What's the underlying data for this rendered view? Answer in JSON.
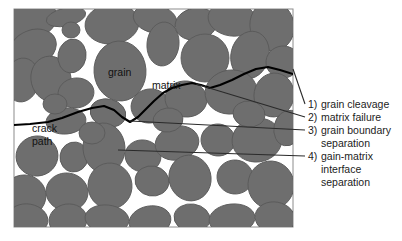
{
  "figure": {
    "colors": {
      "grain_fill": "#6e6e6e",
      "grain_stroke": "#5a5a5a",
      "matrix_fill": "#ffffff",
      "crack_line": "#000000",
      "leader_line": "#2a2a2a",
      "text": "#1c1c1c",
      "frame": "#8c8c8c"
    },
    "inner_labels": [
      {
        "id": "grain",
        "text": "grain",
        "x": 108,
        "y": 76
      },
      {
        "id": "matrix",
        "text": "matrix",
        "x": 152,
        "y": 89
      },
      {
        "id": "crack-path-line1",
        "text": "crack",
        "x": 32,
        "y": 132
      },
      {
        "id": "crack-path-line2",
        "text": "path",
        "x": 32,
        "y": 145
      }
    ],
    "legend": {
      "items": [
        {
          "index": "1)",
          "lines": [
            "grain cleavage"
          ],
          "x": 308,
          "y": 108
        },
        {
          "index": "2)",
          "lines": [
            "matrix failure"
          ],
          "x": 308,
          "y": 121
        },
        {
          "index": "3)",
          "lines": [
            "grain boundary",
            "separation"
          ],
          "x": 308,
          "y": 134
        },
        {
          "index": "4)",
          "lines": [
            "gain-matrix",
            "interface",
            "separation"
          ],
          "x": 308,
          "y": 160
        }
      ]
    },
    "frame": {
      "x": 14,
      "y": 9,
      "width": 279,
      "height": 218
    },
    "crack_path": "M 14,125 L 30,124 L 48,122 L 62,118 L 78,112 L 92,108 L 104,106 L 114,110 L 122,117 L 130,122 L 138,117 L 145,110 L 154,101 L 163,93 L 172,88 L 182,85 L 192,83 L 201,85 L 210,88 L 220,85 L 232,80 L 244,74 L 256,69 L 268,67 L 280,70 L 293,74",
    "leader_lines": [
      {
        "id": "leader-1",
        "from": [
          293,
          69
        ],
        "to": [
          305,
          104
        ]
      },
      {
        "id": "leader-2",
        "from": [
          196,
          84
        ],
        "to": [
          305,
          117
        ]
      },
      {
        "id": "leader-3",
        "from": [
          130,
          121
        ],
        "to": [
          305,
          130
        ]
      },
      {
        "id": "leader-4",
        "from": [
          118,
          150
        ],
        "to": [
          305,
          156
        ]
      }
    ],
    "grains": [
      {
        "cx": 28,
        "cy": 22,
        "rx": 30,
        "ry": 19,
        "rot": -18
      },
      {
        "cx": 66,
        "cy": 17,
        "rx": 20,
        "ry": 9,
        "rot": -12
      },
      {
        "cx": 71,
        "cy": 30,
        "rx": 9,
        "ry": 8,
        "rot": 0
      },
      {
        "cx": 33,
        "cy": 48,
        "rx": 24,
        "ry": 18,
        "rot": -22
      },
      {
        "cx": 22,
        "cy": 80,
        "rx": 17,
        "ry": 22,
        "rot": 8
      },
      {
        "cx": 51,
        "cy": 79,
        "rx": 20,
        "ry": 23,
        "rot": -14
      },
      {
        "cx": 72,
        "cy": 56,
        "rx": 14,
        "ry": 17,
        "rot": 10
      },
      {
        "cx": 76,
        "cy": 93,
        "rx": 18,
        "ry": 15,
        "rot": -8
      },
      {
        "cx": 112,
        "cy": 24,
        "rx": 27,
        "ry": 20,
        "rot": -6
      },
      {
        "cx": 155,
        "cy": 19,
        "rx": 22,
        "ry": 14,
        "rot": 12
      },
      {
        "cx": 120,
        "cy": 71,
        "rx": 26,
        "ry": 30,
        "rot": -4
      },
      {
        "cx": 163,
        "cy": 44,
        "rx": 16,
        "ry": 22,
        "rot": 6
      },
      {
        "cx": 196,
        "cy": 24,
        "rx": 21,
        "ry": 16,
        "rot": -10
      },
      {
        "cx": 232,
        "cy": 19,
        "rx": 24,
        "ry": 17,
        "rot": 8
      },
      {
        "cx": 272,
        "cy": 26,
        "rx": 22,
        "ry": 25,
        "rot": -12
      },
      {
        "cx": 205,
        "cy": 58,
        "rx": 24,
        "ry": 24,
        "rot": 0
      },
      {
        "cx": 250,
        "cy": 55,
        "rx": 19,
        "ry": 24,
        "rot": 14
      },
      {
        "cx": 283,
        "cy": 62,
        "rx": 17,
        "ry": 16,
        "rot": -6
      },
      {
        "cx": 150,
        "cy": 106,
        "rx": 19,
        "ry": 17,
        "rot": -10
      },
      {
        "cx": 186,
        "cy": 99,
        "rx": 21,
        "ry": 18,
        "rot": 6
      },
      {
        "cx": 231,
        "cy": 92,
        "rx": 26,
        "ry": 22,
        "rot": -8
      },
      {
        "cx": 274,
        "cy": 95,
        "rx": 20,
        "ry": 22,
        "rot": 10
      },
      {
        "cx": 108,
        "cy": 113,
        "rx": 18,
        "ry": 14,
        "rot": 14
      },
      {
        "cx": 66,
        "cy": 121,
        "rx": 20,
        "ry": 13,
        "rot": -6
      },
      {
        "cx": 37,
        "cy": 156,
        "rx": 21,
        "ry": 20,
        "rot": -14
      },
      {
        "cx": 74,
        "cy": 157,
        "rx": 14,
        "ry": 15,
        "rot": 8
      },
      {
        "cx": 104,
        "cy": 148,
        "rx": 21,
        "ry": 25,
        "rot": -4
      },
      {
        "cx": 143,
        "cy": 156,
        "rx": 18,
        "ry": 16,
        "rot": 10
      },
      {
        "cx": 177,
        "cy": 143,
        "rx": 22,
        "ry": 17,
        "rot": -12
      },
      {
        "cx": 218,
        "cy": 140,
        "rx": 17,
        "ry": 16,
        "rot": 6
      },
      {
        "cx": 257,
        "cy": 140,
        "rx": 25,
        "ry": 22,
        "rot": -8
      },
      {
        "cx": 288,
        "cy": 128,
        "rx": 14,
        "ry": 18,
        "rot": 12
      },
      {
        "cx": 24,
        "cy": 196,
        "rx": 22,
        "ry": 21,
        "rot": -10
      },
      {
        "cx": 67,
        "cy": 192,
        "rx": 21,
        "ry": 19,
        "rot": 8
      },
      {
        "cx": 110,
        "cy": 186,
        "rx": 22,
        "ry": 23,
        "rot": -6
      },
      {
        "cx": 152,
        "cy": 181,
        "rx": 17,
        "ry": 15,
        "rot": 10
      },
      {
        "cx": 190,
        "cy": 178,
        "rx": 21,
        "ry": 23,
        "rot": -14
      },
      {
        "cx": 235,
        "cy": 177,
        "rx": 18,
        "ry": 17,
        "rot": 6
      },
      {
        "cx": 271,
        "cy": 185,
        "rx": 23,
        "ry": 24,
        "rot": -8
      },
      {
        "cx": 28,
        "cy": 219,
        "rx": 20,
        "ry": 15,
        "rot": 10
      },
      {
        "cx": 68,
        "cy": 220,
        "rx": 19,
        "ry": 16,
        "rot": -8
      },
      {
        "cx": 107,
        "cy": 219,
        "rx": 22,
        "ry": 14,
        "rot": 6
      },
      {
        "cx": 150,
        "cy": 221,
        "rx": 21,
        "ry": 15,
        "rot": -10
      },
      {
        "cx": 192,
        "cy": 218,
        "rx": 18,
        "ry": 14,
        "rot": 8
      },
      {
        "cx": 232,
        "cy": 219,
        "rx": 23,
        "ry": 15,
        "rot": -6
      },
      {
        "cx": 275,
        "cy": 218,
        "rx": 20,
        "ry": 16,
        "rot": 10
      },
      {
        "cx": 92,
        "cy": 133,
        "rx": 13,
        "ry": 11,
        "rot": 0
      },
      {
        "cx": 168,
        "cy": 120,
        "rx": 15,
        "ry": 12,
        "rot": -8
      },
      {
        "cx": 249,
        "cy": 114,
        "rx": 16,
        "ry": 13,
        "rot": 6
      },
      {
        "cx": 55,
        "cy": 104,
        "rx": 12,
        "ry": 10,
        "rot": 0
      }
    ]
  }
}
